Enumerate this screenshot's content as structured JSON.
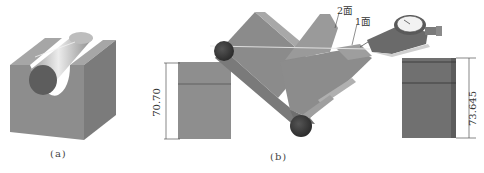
{
  "figure": {
    "subfigures": [
      {
        "id": "a",
        "caption": "(a)",
        "description": "V-block with cylinder resting in groove"
      },
      {
        "id": "b",
        "caption": "(b)",
        "description": "Tilted V-block with two rollers and dial gauge measuring face 1"
      }
    ],
    "labels": {
      "face2": "2面",
      "face1": "1面"
    },
    "dimensions": {
      "left_block_height": "70.70",
      "right_block_height": "73.645"
    },
    "colors": {
      "block_gray": "#8a8a8a",
      "block_dark": "#6e6e6e",
      "block_light": "#a9a9a9",
      "roller_dark": "#3a3a3a",
      "dim_line": "#555555"
    }
  }
}
